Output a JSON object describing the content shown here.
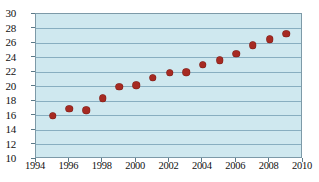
{
  "chart_data": {
    "type": "scatter",
    "title": "",
    "xlabel": "",
    "ylabel": "",
    "xlim": [
      1994,
      2010
    ],
    "ylim": [
      10,
      30
    ],
    "grid": true,
    "legend": "none",
    "marker_color": "#a62a22",
    "plot_background": "#cfe8ef",
    "gridline_color": "#88aec0",
    "border_color": "#7d9aa8",
    "y_ticks": [
      10,
      12,
      14,
      16,
      18,
      20,
      22,
      24,
      26,
      28,
      30
    ],
    "x_ticks": [
      1994,
      1996,
      1998,
      2000,
      2002,
      2004,
      2006,
      2008,
      2010
    ],
    "x": [
      1995,
      1996,
      1997,
      1998,
      1999,
      2000,
      2001,
      2002,
      2003,
      2004,
      2005,
      2006,
      2007,
      2008,
      2009
    ],
    "values": [
      16.0,
      16.9,
      16.7,
      18.4,
      20.0,
      20.2,
      21.2,
      21.9,
      22.0,
      23.0,
      23.6,
      24.5,
      25.7,
      26.5,
      27.3
    ],
    "points": [
      {
        "x": 1995,
        "y": 16.0
      },
      {
        "x": 1996,
        "y": 16.9
      },
      {
        "x": 1997,
        "y": 16.7
      },
      {
        "x": 1998,
        "y": 18.4
      },
      {
        "x": 1999,
        "y": 20.0
      },
      {
        "x": 2000,
        "y": 20.2
      },
      {
        "x": 2001,
        "y": 21.2
      },
      {
        "x": 2002,
        "y": 21.9
      },
      {
        "x": 2003,
        "y": 22.0
      },
      {
        "x": 2004,
        "y": 23.0
      },
      {
        "x": 2005,
        "y": 23.6
      },
      {
        "x": 2006,
        "y": 24.5
      },
      {
        "x": 2007,
        "y": 25.7
      },
      {
        "x": 2008,
        "y": 26.5
      },
      {
        "x": 2009,
        "y": 27.3
      }
    ]
  }
}
